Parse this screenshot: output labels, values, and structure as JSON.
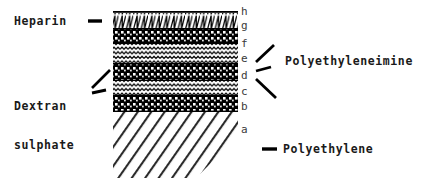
{
  "figure": {
    "background_color": "#ffffff",
    "ink_color": "#000000"
  },
  "labels": {
    "heparin": "Heparin",
    "dextran_line1": "Dextran",
    "dextran_line2": "sulphate",
    "polyethyleneimine": "Polyethyleneimine",
    "polyethylene": "Polyethylene"
  },
  "layer_letters": [
    {
      "key": "h",
      "letter": "h",
      "x": 241,
      "y": 6,
      "layer": "top-surface-line"
    },
    {
      "key": "g",
      "letter": "g",
      "x": 241,
      "y": 20,
      "layer": "heparin-zigzag"
    },
    {
      "key": "f",
      "letter": "f",
      "x": 241,
      "y": 38,
      "layer": "polyethyleneimine-dotted-3"
    },
    {
      "key": "e",
      "letter": "e",
      "x": 241,
      "y": 53,
      "layer": "dextran-sulphate-wavy-2"
    },
    {
      "key": "d",
      "letter": "d",
      "x": 241,
      "y": 70,
      "layer": "polyethyleneimine-dotted-2"
    },
    {
      "key": "c",
      "letter": "c",
      "x": 241,
      "y": 86,
      "layer": "dextran-sulphate-wavy-1"
    },
    {
      "key": "b",
      "letter": "b",
      "x": 241,
      "y": 101,
      "layer": "polyethyleneimine-dotted-1"
    },
    {
      "key": "a",
      "letter": "a",
      "x": 241,
      "y": 124,
      "layer": "polyethylene-substrate"
    }
  ],
  "stack": {
    "left": 113,
    "right": 238,
    "bands": [
      {
        "name": "surface-line",
        "pattern": "solid-line",
        "y": 11,
        "height": 2,
        "letter": "h"
      },
      {
        "name": "heparin-zigzag",
        "pattern": "zigzag",
        "y": 13,
        "height": 15,
        "letter": "g"
      },
      {
        "name": "pei-dotted-top",
        "pattern": "dotted",
        "y": 28,
        "height": 16,
        "letter": "f"
      },
      {
        "name": "dextran-wavy-top",
        "pattern": "wavy",
        "y": 44,
        "height": 19,
        "letter": "e"
      },
      {
        "name": "pei-dotted-mid",
        "pattern": "dotted",
        "y": 63,
        "height": 18,
        "letter": "d"
      },
      {
        "name": "dextran-wavy-bot",
        "pattern": "wavy",
        "y": 81,
        "height": 14,
        "letter": "c"
      },
      {
        "name": "pei-dotted-bot",
        "pattern": "dotted",
        "y": 95,
        "height": 17,
        "letter": "b"
      },
      {
        "name": "polyethylene-base",
        "pattern": "hatched",
        "y": 112,
        "height": 66,
        "letter": "a"
      }
    ]
  },
  "leaders": {
    "heparin": [
      {
        "x1": 88,
        "y1": 21,
        "x2": 102,
        "y2": 21
      }
    ],
    "dextran": [
      {
        "x1": 92,
        "y1": 88,
        "x2": 110,
        "y2": 70
      },
      {
        "x1": 92,
        "y1": 93,
        "x2": 106,
        "y2": 90
      }
    ],
    "polyethyleneimine": [
      {
        "x1": 255,
        "y1": 62,
        "x2": 273,
        "y2": 45
      },
      {
        "x1": 255,
        "y1": 71,
        "x2": 270,
        "y2": 67
      },
      {
        "x1": 255,
        "y1": 79,
        "x2": 275,
        "y2": 97
      }
    ],
    "polyethylene": [
      {
        "x1": 262,
        "y1": 149,
        "x2": 277,
        "y2": 149
      }
    ]
  }
}
